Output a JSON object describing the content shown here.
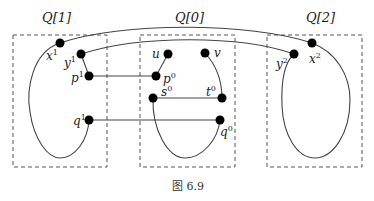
{
  "figure": {
    "caption": "图 6.9",
    "colors": {
      "stroke": "#444444",
      "node": "#000000",
      "box": "#555555"
    }
  },
  "boxes": [
    {
      "id": "Q1",
      "label": "Q[1]",
      "x": 13,
      "y": 35,
      "w": 94,
      "h": 132,
      "label_x": 55,
      "label_y": 21
    },
    {
      "id": "Q0",
      "label": "Q[0]",
      "x": 140,
      "y": 35,
      "w": 95,
      "h": 132,
      "label_x": 188,
      "label_y": 21
    },
    {
      "id": "Q2",
      "label": "Q[2]",
      "x": 267,
      "y": 35,
      "w": 95,
      "h": 132,
      "label_x": 320,
      "label_y": 21
    }
  ],
  "nodes": [
    {
      "id": "x1",
      "base": "x",
      "sup": "1",
      "cx": 60,
      "cy": 43,
      "lx": 47,
      "ly": 64
    },
    {
      "id": "y1",
      "base": "y",
      "sup": "1",
      "cx": 81,
      "cy": 54,
      "lx": 66,
      "ly": 68
    },
    {
      "id": "p1",
      "base": "p",
      "sup": "1",
      "cx": 89,
      "cy": 76,
      "lx": 72,
      "ly": 80
    },
    {
      "id": "q1",
      "base": "q",
      "sup": "1",
      "cx": 89,
      "cy": 120,
      "lx": 73,
      "ly": 124
    },
    {
      "id": "u",
      "base": "u",
      "sup": "",
      "cx": 168,
      "cy": 54,
      "lx": 152,
      "ly": 58
    },
    {
      "id": "v",
      "base": "v",
      "sup": "",
      "cx": 205,
      "cy": 53,
      "lx": 214,
      "ly": 57
    },
    {
      "id": "p0",
      "base": "p",
      "sup": "0",
      "cx": 156,
      "cy": 76,
      "lx": 164,
      "ly": 80
    },
    {
      "id": "s0",
      "base": "s",
      "sup": "0",
      "cx": 153,
      "cy": 98,
      "lx": 161,
      "ly": 98
    },
    {
      "id": "t0",
      "base": "t",
      "sup": "0",
      "cx": 222,
      "cy": 98,
      "lx": 207,
      "ly": 98
    },
    {
      "id": "q0",
      "base": "q",
      "sup": "0",
      "cx": 220,
      "cy": 120,
      "lx": 221,
      "ly": 133
    },
    {
      "id": "y2",
      "base": "y",
      "sup": "2",
      "cx": 294,
      "cy": 54,
      "lx": 277,
      "ly": 67
    },
    {
      "id": "x2",
      "base": "x",
      "sup": "2",
      "cx": 312,
      "cy": 43,
      "lx": 311,
      "ly": 62
    }
  ],
  "edges": [
    {
      "from": "x1",
      "to": "x2",
      "type": "arc"
    },
    {
      "from": "y1",
      "to": "y2",
      "type": "arc"
    },
    {
      "from": "y1",
      "to": "p1",
      "type": "line"
    },
    {
      "from": "p1",
      "to": "p0",
      "type": "line"
    },
    {
      "from": "u",
      "to": "p0",
      "type": "line"
    },
    {
      "from": "s0",
      "to": "t0",
      "type": "line"
    },
    {
      "from": "v",
      "to": "t0",
      "type": "curve"
    },
    {
      "from": "q1",
      "to": "q0",
      "type": "line"
    },
    {
      "from": "s0",
      "to": "q0",
      "type": "loop-down"
    },
    {
      "from": "x1",
      "to": "q1",
      "type": "loop-down"
    },
    {
      "from": "x2",
      "to": "y2",
      "type": "loop-down"
    }
  ]
}
